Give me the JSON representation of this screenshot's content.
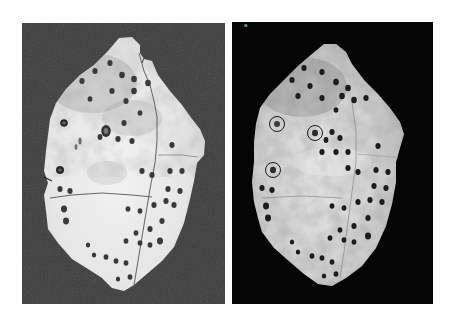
{
  "figure": {
    "panels": [
      {
        "id": "left",
        "description": "Photograph of perforated bone/shell plate fragment on dark gray background",
        "background": "#3b3b3b",
        "bone_color": "#e9e9e9",
        "circled_marks": 0
      },
      {
        "id": "right",
        "label": "a",
        "description": "Enhanced photograph of same bone fragment on black background with three circled marks",
        "background": "#050505",
        "bone_color": "#dcdcdc",
        "circled_marks": 3
      }
    ]
  }
}
